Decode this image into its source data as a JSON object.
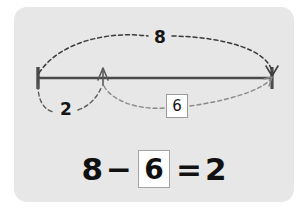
{
  "card": {
    "background_color": "#e7e7e7"
  },
  "diagram": {
    "type": "number-line-bar-model",
    "line_color": "#4a4a4a",
    "arc_color": "#6f6f6f",
    "whole_label": "8",
    "part_left_label": "2",
    "part_right_label": "6",
    "ticks": [
      "left-endpoint",
      "middle-point",
      "right-endpoint"
    ]
  },
  "equation": {
    "left_operand": "8",
    "operator": "−",
    "boxed_answer": "6",
    "equals": "=",
    "result": "2",
    "full_text": "8 − 6 = 2"
  }
}
